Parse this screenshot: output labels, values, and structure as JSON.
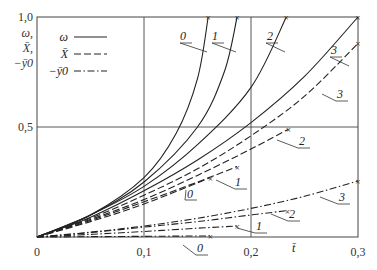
{
  "chart_data": {
    "type": "line",
    "title": "",
    "xlabel": "t̄",
    "ylabel": "ω, X̄, −ȳ0",
    "xlim": [
      0,
      0.3
    ],
    "ylim": [
      0,
      1.0
    ],
    "x_ticks": [
      "0",
      "0,1",
      "0,2",
      "0,3"
    ],
    "y_ticks": [
      "0,5",
      "1,0"
    ],
    "grid": true,
    "legend": {
      "position": "upper-left",
      "entries": [
        {
          "label": "ω",
          "style": "solid"
        },
        {
          "label": "X̄",
          "style": "dashed"
        },
        {
          "label": "−ȳ0",
          "style": "dashdot"
        }
      ]
    },
    "series": [
      {
        "name": "ω 0",
        "style": "solid",
        "curve_label": "0",
        "x": [
          0,
          0.05,
          0.1,
          0.13,
          0.15,
          0.16
        ],
        "values": [
          0,
          0.1,
          0.27,
          0.47,
          0.72,
          1.0
        ]
      },
      {
        "name": "ω 1",
        "style": "solid",
        "curve_label": "1",
        "x": [
          0,
          0.05,
          0.1,
          0.15,
          0.175,
          0.187
        ],
        "values": [
          0,
          0.1,
          0.25,
          0.5,
          0.75,
          1.0
        ]
      },
      {
        "name": "ω 2",
        "style": "solid",
        "curve_label": "2",
        "x": [
          0,
          0.05,
          0.1,
          0.15,
          0.2,
          0.233
        ],
        "values": [
          0,
          0.1,
          0.23,
          0.42,
          0.68,
          1.0
        ]
      },
      {
        "name": "ω 3",
        "style": "solid",
        "curve_label": "3",
        "x": [
          0,
          0.05,
          0.1,
          0.15,
          0.2,
          0.25,
          0.3
        ],
        "values": [
          0,
          0.09,
          0.21,
          0.35,
          0.52,
          0.73,
          1.0
        ]
      },
      {
        "name": "X̄ 0",
        "style": "dashed",
        "curve_label": "0",
        "x": [
          0,
          0.05,
          0.1,
          0.162
        ],
        "values": [
          0,
          0.07,
          0.15,
          0.27
        ]
      },
      {
        "name": "X̄ 1",
        "style": "dashed",
        "curve_label": "1",
        "x": [
          0,
          0.05,
          0.1,
          0.15,
          0.187
        ],
        "values": [
          0,
          0.075,
          0.16,
          0.25,
          0.32
        ]
      },
      {
        "name": "X̄ 2",
        "style": "dashed",
        "curve_label": "2",
        "x": [
          0,
          0.05,
          0.1,
          0.15,
          0.2,
          0.235
        ],
        "values": [
          0,
          0.08,
          0.17,
          0.28,
          0.4,
          0.49
        ]
      },
      {
        "name": "X̄ 3",
        "style": "dashed",
        "curve_label": "3",
        "x": [
          0,
          0.05,
          0.1,
          0.15,
          0.2,
          0.25,
          0.3
        ],
        "values": [
          0,
          0.085,
          0.19,
          0.31,
          0.46,
          0.64,
          0.88
        ]
      },
      {
        "name": "−ȳ0 0",
        "style": "dashdot",
        "curve_label": "0",
        "x": [
          0,
          0.1,
          0.162
        ],
        "values": [
          0,
          0.003,
          0.005
        ]
      },
      {
        "name": "−ȳ0 1",
        "style": "dashdot",
        "curve_label": "1",
        "x": [
          0,
          0.05,
          0.1,
          0.15,
          0.187
        ],
        "values": [
          0,
          0.012,
          0.025,
          0.04,
          0.05
        ]
      },
      {
        "name": "−ȳ0 2",
        "style": "dashdot",
        "curve_label": "2",
        "x": [
          0,
          0.05,
          0.1,
          0.15,
          0.2,
          0.234
        ],
        "values": [
          0,
          0.02,
          0.045,
          0.07,
          0.1,
          0.12
        ]
      },
      {
        "name": "−ȳ0 3",
        "style": "dashdot",
        "curve_label": "3",
        "x": [
          0,
          0.05,
          0.1,
          0.15,
          0.2,
          0.25,
          0.3
        ],
        "values": [
          0,
          0.022,
          0.05,
          0.085,
          0.13,
          0.185,
          0.255
        ]
      }
    ]
  },
  "axes": {
    "y_label_lines": [
      "ω,",
      "X̄,",
      "−ȳ0"
    ],
    "x_label": "t̄"
  }
}
